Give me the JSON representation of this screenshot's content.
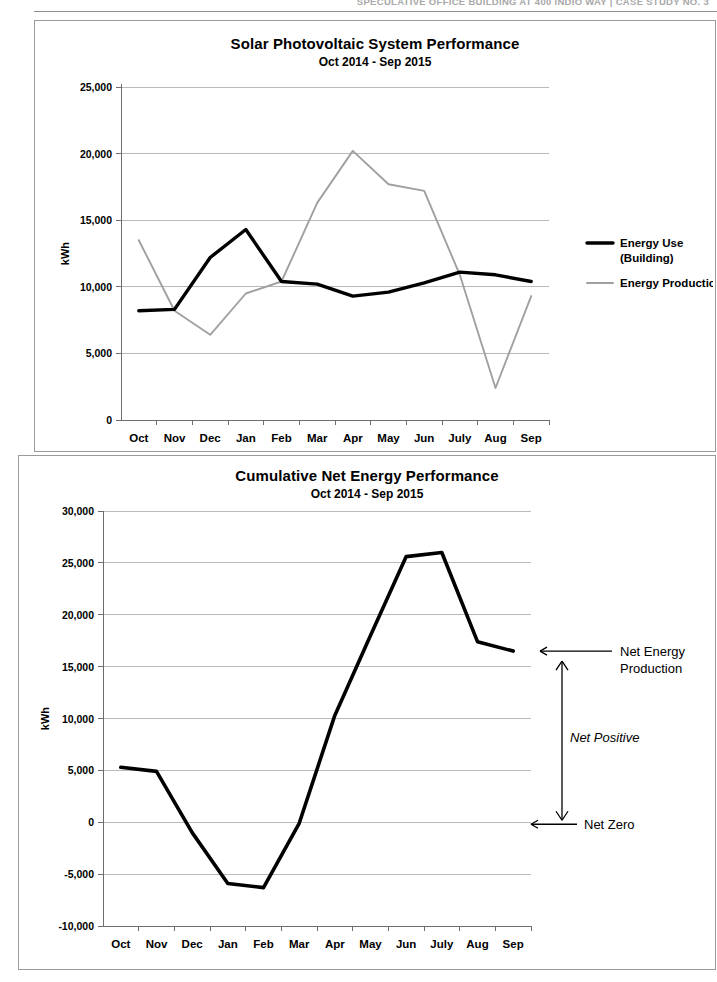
{
  "document": {
    "running_header": "SPECULATIVE OFFICE BUILDING AT 400 INDIO WAY  |  CASE STUDY NO. 3",
    "running_header_plain": "SPECULATIVE OFFICE BUILDING AT 400 INDIO WAY",
    "running_header_bold": "|  CASE STUDY NO. 3"
  },
  "colors": {
    "energy_use": "#000000",
    "energy_production": "#a0a0a0",
    "gridline": "#b9b9b9",
    "axis": "#6e6e6e",
    "frame": "#9a9a9a"
  },
  "chart_data": [
    {
      "type": "line",
      "id": "solar-pv-performance",
      "title": "Solar Photovoltaic System Performance",
      "subtitle": "Oct 2014 - Sep 2015",
      "xlabel": "",
      "ylabel": "kWh",
      "ylim": [
        0,
        25000
      ],
      "yticks": [
        0,
        5000,
        10000,
        15000,
        20000,
        25000
      ],
      "ytick_labels": [
        "0",
        "5,000",
        "10,000",
        "15,000",
        "20,000",
        "25,000"
      ],
      "grid": true,
      "legend_position": "right",
      "categories": [
        "Oct",
        "Nov",
        "Dec",
        "Jan",
        "Feb",
        "Mar",
        "Apr",
        "May",
        "Jun",
        "July",
        "Aug",
        "Sep"
      ],
      "series": [
        {
          "name": "Energy Use (Building)",
          "legend_line1": "Energy Use",
          "legend_line2": "(Building)",
          "color": "#000000",
          "values": [
            8200,
            8300,
            12200,
            14300,
            10400,
            10200,
            9300,
            9600,
            10300,
            11100,
            10900,
            10400
          ]
        },
        {
          "name": "Energy Production",
          "legend_line1": "Energy Production",
          "legend_line2": "",
          "color": "#a0a0a0",
          "values": [
            13500,
            8200,
            6400,
            9500,
            10400,
            16300,
            20200,
            17700,
            17200,
            10900,
            2400,
            9300
          ]
        }
      ]
    },
    {
      "type": "line",
      "id": "cumulative-net-energy",
      "title": "Cumulative Net Energy Performance",
      "subtitle": "Oct 2014 - Sep 2015",
      "xlabel": "",
      "ylabel": "kWh",
      "ylim": [
        -10000,
        30000
      ],
      "yticks": [
        -10000,
        -5000,
        0,
        5000,
        10000,
        15000,
        20000,
        25000,
        30000
      ],
      "ytick_labels": [
        "-10,000",
        "-5,000",
        "0",
        "5,000",
        "10,000",
        "15,000",
        "20,000",
        "25,000",
        "30,000"
      ],
      "grid": true,
      "legend_position": "none",
      "categories": [
        "Oct",
        "Nov",
        "Dec",
        "Jan",
        "Feb",
        "Mar",
        "Apr",
        "May",
        "Jun",
        "July",
        "Aug",
        "Sep"
      ],
      "series": [
        {
          "name": "Cumulative Net Energy",
          "color": "#000000",
          "values": [
            5300,
            4900,
            -1000,
            -5900,
            -6300,
            -100,
            10300,
            18000,
            25600,
            26000,
            17400,
            16500
          ]
        }
      ],
      "annotations": [
        {
          "id": "net-energy-production",
          "line1": "Net Energy",
          "line2": "Production",
          "at_value": 16500
        },
        {
          "id": "net-positive",
          "text": "Net Positive",
          "style": "italic"
        },
        {
          "id": "net-zero",
          "text": "Net Zero",
          "at_value": 0
        }
      ]
    }
  ]
}
